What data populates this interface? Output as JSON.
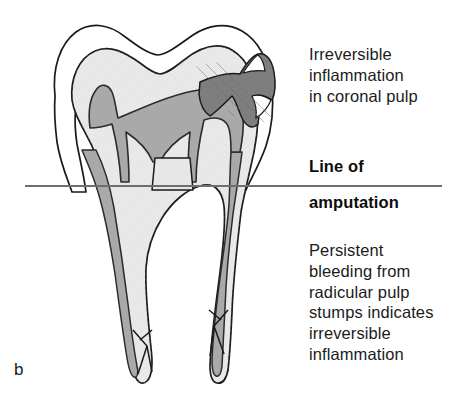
{
  "figure": {
    "panel_label": "b",
    "background_color": "#ffffff"
  },
  "annotations": {
    "coronal": {
      "text": "Irreversible\ninflammation\nin coronal pulp",
      "lines": [
        "Irreversible",
        "inflammation",
        "in coronal pulp"
      ],
      "bold": false
    },
    "amputation": {
      "line_1": "Line of",
      "line_2": "amputation",
      "bold": true
    },
    "radicular": {
      "text": "Persistent\nbleeding from\nradicular pulp\nstumps indicates\nirreversible\ninflammation",
      "lines": [
        "Persistent",
        "bleeding from",
        "radicular pulp",
        "stumps indicates",
        "irreversible",
        "inflammation"
      ],
      "bold": false
    }
  },
  "amputation_line": {
    "label": "amputation-line",
    "x_start": 25,
    "x_end": 442,
    "y": 186,
    "color": "#6e6e6e",
    "thickness": 2
  },
  "anatomy": {
    "enamel": {
      "name": "enamel",
      "fill": "#ffffff",
      "stroke": "#1a1a1a"
    },
    "dentin": {
      "name": "dentin",
      "fill": "#e7e7e7",
      "stroke": "#1a1a1a"
    },
    "pulp": {
      "name": "pulp-chamber-and-canals",
      "fill": "#a9a9a9",
      "stroke": "#2b2b2b"
    },
    "caries": {
      "name": "carious-lesion",
      "fill": "#7e7e7e",
      "stroke": "#1a1a1a"
    },
    "roots": {
      "count": 2,
      "apex_branching": true
    }
  }
}
